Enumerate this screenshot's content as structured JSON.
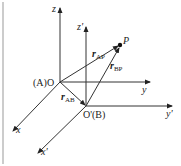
{
  "diagram": {
    "type": "coordinate-frames",
    "frame_A": {
      "origin_label": "(A)O",
      "axes": {
        "x": "x",
        "y": "y",
        "z": "z"
      }
    },
    "frame_B": {
      "origin_label": "O'(B)",
      "axes": {
        "x": "x'",
        "y": "y'",
        "z": "z'"
      }
    },
    "point": {
      "label": "P"
    },
    "vectors": {
      "r_AP": {
        "main": "r",
        "sub": "AP"
      },
      "r_BP": {
        "main": "r",
        "sub": "BP"
      },
      "r_AB": {
        "main": "r",
        "sub": "AB"
      }
    },
    "colors": {
      "line": "#333333",
      "border": "#bbbbbb"
    }
  }
}
